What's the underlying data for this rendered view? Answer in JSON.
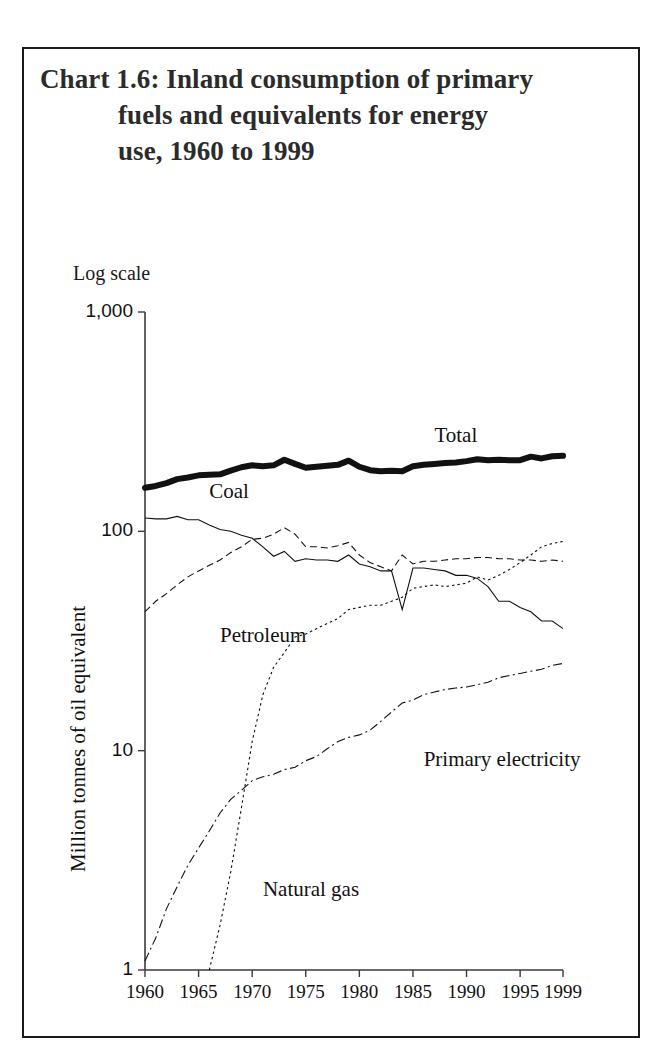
{
  "title": {
    "line1": "Chart 1.6: Inland consumption of primary",
    "line2": "fuels and equivalents for energy",
    "line3": "use, 1960 to 1999"
  },
  "chart_data": {
    "type": "line",
    "title": "Chart 1.6: Inland consumption of primary fuels and equivalents for energy use, 1960 to 1999",
    "scale_note": "Log scale",
    "xlabel": "",
    "ylabel": "Million tonnes of oil equivalent",
    "yscale": "log",
    "ylim": [
      1,
      1000
    ],
    "yticks": [
      1,
      10,
      100,
      1000
    ],
    "ytick_labels": [
      "1",
      "10",
      "100",
      "1,000"
    ],
    "xlim": [
      1960,
      1999
    ],
    "xticks": [
      1960,
      1965,
      1970,
      1975,
      1980,
      1985,
      1990,
      1995,
      1999
    ],
    "xtick_labels": [
      "1960",
      "1965",
      "1970",
      "1975",
      "1980",
      "1985",
      "1990",
      "1995",
      "1999"
    ],
    "grid": false,
    "legend_position": "inline-annotations",
    "x": [
      1960,
      1961,
      1962,
      1963,
      1964,
      1965,
      1966,
      1967,
      1968,
      1969,
      1970,
      1971,
      1972,
      1973,
      1974,
      1975,
      1976,
      1977,
      1978,
      1979,
      1980,
      1981,
      1982,
      1983,
      1984,
      1985,
      1986,
      1987,
      1988,
      1989,
      1990,
      1991,
      1992,
      1993,
      1994,
      1995,
      1996,
      1997,
      1998,
      1999
    ],
    "series": [
      {
        "name": "Total",
        "style": "solid-thick",
        "label_x": 1987,
        "label_y": 270,
        "values": [
          158,
          161,
          166,
          173,
          176,
          180,
          181,
          182,
          189,
          196,
          200,
          198,
          200,
          212,
          203,
          195,
          197,
          199,
          201,
          210,
          197,
          190,
          188,
          189,
          188,
          198,
          201,
          203,
          205,
          206,
          209,
          213,
          211,
          212,
          211,
          211,
          219,
          215,
          220,
          221
        ]
      },
      {
        "name": "Coal",
        "style": "solid-thin",
        "label_x": 1966,
        "label_y": 150,
        "values": [
          115,
          114,
          114,
          117,
          113,
          113,
          107,
          102,
          100,
          96,
          93,
          85,
          77,
          81,
          73,
          75,
          74,
          74,
          73,
          78,
          71,
          69,
          66,
          66,
          44,
          68,
          68,
          67,
          66,
          63,
          63,
          61,
          56,
          48,
          48,
          45,
          43,
          39,
          39,
          36
        ]
      },
      {
        "name": "Petroleum",
        "style": "dashed",
        "label_x": 1967,
        "label_y": 33,
        "values": [
          43,
          48,
          52,
          57,
          62,
          66,
          70,
          74,
          80,
          85,
          92,
          93,
          97,
          104,
          97,
          85,
          85,
          84,
          86,
          89,
          78,
          72,
          69,
          66,
          78,
          71,
          73,
          73,
          74,
          75,
          75,
          76,
          76,
          75,
          75,
          74,
          74,
          73,
          74,
          73
        ]
      },
      {
        "name": "Natural gas",
        "style": "dotted",
        "label_x": 1971,
        "label_y": 2.3,
        "values": [
          null,
          null,
          null,
          null,
          null,
          null,
          1.0,
          1.6,
          2.8,
          5.5,
          11,
          18,
          24,
          28,
          33,
          34,
          36,
          38,
          40,
          44,
          45,
          46,
          46,
          48,
          50,
          55,
          56,
          57,
          56,
          57,
          58,
          62,
          60,
          63,
          67,
          72,
          78,
          85,
          88,
          90
        ]
      },
      {
        "name": "Primary electricity",
        "style": "dash-dot",
        "label_x": 1986,
        "label_y": 9.0,
        "values": [
          1.1,
          1.4,
          1.9,
          2.4,
          3.0,
          3.6,
          4.3,
          5.2,
          6.0,
          6.6,
          7.3,
          7.6,
          7.8,
          8.2,
          8.4,
          9.0,
          9.4,
          10.2,
          11.0,
          11.5,
          11.8,
          12.4,
          13.6,
          15.0,
          16.5,
          17.0,
          18.0,
          18.5,
          19.0,
          19.3,
          19.5,
          20.0,
          20.5,
          21.5,
          22.0,
          22.5,
          23.0,
          23.5,
          24.5,
          25.0
        ]
      }
    ]
  }
}
